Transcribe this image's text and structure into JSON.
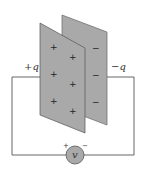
{
  "diagram": {
    "colors": {
      "plate_fill": "#a9a9a9",
      "plate_stroke": "#555555",
      "wire": "#555555",
      "voltmeter_fill": "#a9a9a9",
      "background": "#ffffff"
    },
    "labels": {
      "left_charge": "+q",
      "right_charge": "−q",
      "voltmeter": "v",
      "voltmeter_positive": "+",
      "voltmeter_negative": "−"
    },
    "front_plate": {
      "name": "positive plate",
      "signs": [
        "+",
        "+",
        "+",
        "+",
        "+",
        "+"
      ]
    },
    "back_plate": {
      "name": "negative plate",
      "signs": [
        "−",
        "−",
        "−"
      ]
    }
  }
}
